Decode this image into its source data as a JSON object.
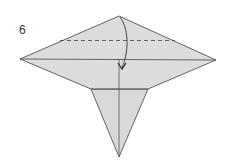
{
  "step": {
    "number": "6"
  },
  "diagram": {
    "paper_color": "#d9d9d9",
    "line_color": "#444444",
    "fold_instruction": "valley-fold top flap down along dashed line",
    "elements": [
      "upper-diamond",
      "lower-triangle",
      "horizontal-crease",
      "vertical-crease",
      "valley-fold-dashed-line",
      "fold-arrow"
    ]
  }
}
